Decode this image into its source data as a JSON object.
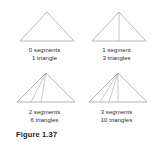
{
  "figure": {
    "caption": "Figure 1.37"
  },
  "panels": [
    {
      "id": "panel-0-segments",
      "segments_label": "0 segments",
      "triangles_label": "1 triangle",
      "segments": 0,
      "triangles": 1
    },
    {
      "id": "panel-1-segment",
      "segments_label": "1 segment",
      "triangles_label": "3 triangles",
      "segments": 1,
      "triangles": 3
    },
    {
      "id": "panel-2-segments",
      "segments_label": "2 segments",
      "triangles_label": "6 triangles",
      "segments": 2,
      "triangles": 6
    },
    {
      "id": "panel-3-segments",
      "segments_label": "3 segments",
      "triangles_label": "10 triangles",
      "segments": 3,
      "triangles": 10
    }
  ],
  "style": {
    "line_color": "#9a9a9a",
    "text_color": "#2b2b2b",
    "caption_color": "#1a1a1a",
    "background": "#ffffff"
  }
}
